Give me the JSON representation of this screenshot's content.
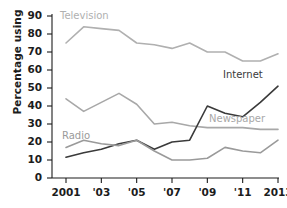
{
  "chart_data": {
    "type": "line",
    "title": "",
    "xlabel": "",
    "ylabel": "Percentage using",
    "xlim": [
      2001,
      2013
    ],
    "ylim": [
      0,
      90
    ],
    "ytick_labels": [
      "90",
      "80",
      "70",
      "60",
      "50",
      "40",
      "30",
      "20",
      "10",
      "0"
    ],
    "ytick_values": [
      90,
      80,
      70,
      60,
      50,
      40,
      30,
      20,
      10,
      0
    ],
    "xtick_labels": [
      "2001",
      "'03",
      "'05",
      "'07",
      "'09",
      "'11",
      "2013"
    ],
    "xtick_values": [
      2001,
      2003,
      2005,
      2007,
      2009,
      2011,
      2013
    ],
    "grid": false,
    "legend": "inline-labels",
    "x": [
      2001,
      2002,
      2003,
      2004,
      2005,
      2006,
      2007,
      2008,
      2009,
      2010,
      2011,
      2012,
      2013
    ],
    "series": [
      {
        "name": "Television",
        "color": "#b0b0b0",
        "label_x": 60,
        "label_y": 10,
        "values": [
          75,
          84,
          83,
          82,
          75,
          74,
          72,
          75,
          70,
          70,
          65,
          65,
          69
        ]
      },
      {
        "name": "Newspaper",
        "color": "#a8a8a8",
        "label_x": 209,
        "label_y": 113,
        "values": [
          44,
          37,
          42,
          47,
          41,
          30,
          31,
          29,
          28,
          28,
          28,
          27,
          27
        ]
      },
      {
        "name": "Internet",
        "color": "#3a3a3a",
        "label_x": 223,
        "label_y": 69,
        "values": [
          11.5,
          14,
          16,
          19,
          21,
          16,
          20,
          21,
          40,
          36,
          34,
          42,
          51
        ]
      },
      {
        "name": "Radio",
        "color": "#9a9a9a",
        "label_x": 62,
        "label_y": 130,
        "values": [
          17,
          21,
          19,
          18,
          21,
          15,
          10,
          10,
          11,
          17,
          15,
          14,
          21
        ]
      }
    ]
  },
  "axis": {
    "y_title": "Percentage using"
  }
}
